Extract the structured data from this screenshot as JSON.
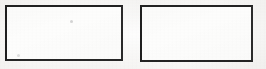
{
  "canvas": {
    "width": 266,
    "height": 69,
    "background_color": "#f6f5f3",
    "description": "Scanned page fragment showing two blank bordered rectangles side by side"
  },
  "shapes": [
    {
      "id": "rect-left",
      "label": "left-rectangle",
      "x": 5,
      "y": 5,
      "width": 118,
      "height": 56,
      "border_width": 2,
      "border_color": "#2b2b2b",
      "fill_color": "#fdfdfc",
      "content": ""
    },
    {
      "id": "rect-right",
      "label": "right-rectangle",
      "x": 140,
      "y": 5,
      "width": 113,
      "height": 57,
      "border_width": 2,
      "border_color": "#2b2b2b",
      "fill_color": "#fdfdfc",
      "content": ""
    }
  ],
  "artifacts": [
    {
      "id": "speck-top",
      "label": "scan-speck",
      "x": 70,
      "y": 20,
      "size": 3,
      "color": "#787878"
    },
    {
      "id": "speck-bottom",
      "label": "scan-speck",
      "x": 17,
      "y": 54,
      "size": 3,
      "color": "#878787"
    }
  ]
}
